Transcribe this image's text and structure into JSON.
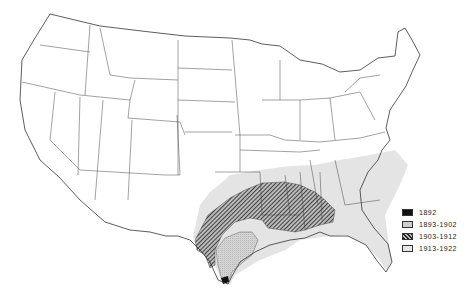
{
  "map": {
    "subject": "Spread by period across the United States",
    "legend": [
      {
        "label": "1892",
        "pattern": "solid",
        "color": "#111111"
      },
      {
        "label": "1893-1902",
        "pattern": "stipple",
        "color": "#cfcfcf"
      },
      {
        "label": "1903-1912",
        "pattern": "hatched",
        "color": "#333333"
      },
      {
        "label": "1913-1922",
        "pattern": "light",
        "color": "#e6e6e6"
      }
    ]
  }
}
